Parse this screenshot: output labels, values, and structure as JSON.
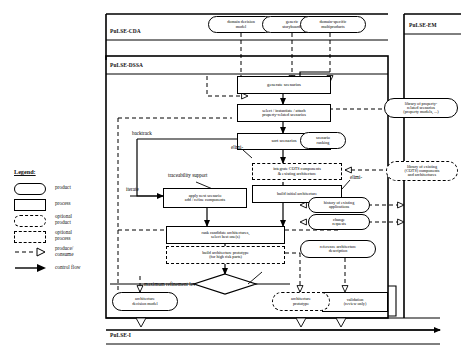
{
  "figure": {
    "caption": ""
  },
  "lanes": [
    {
      "id": "cda",
      "label": "PuLSE-CDA"
    },
    {
      "id": "dssa",
      "label": "PuLSE-DSSA"
    },
    {
      "id": "em",
      "label": "PuLSE-EM"
    },
    {
      "id": "i",
      "label": "PuLSE-I"
    }
  ],
  "products": {
    "domain_decision_model": "domain decision\nmodel",
    "generic_storyboards": "generic\nstoryboards",
    "domain_specific_multiproducts": "domain-specific\nmultiproducts",
    "scenario_ranking": "scenario\nranking",
    "library_property_scenarios": "library of property-\nrelated scenarios\n(property models, ...)",
    "library_cots": "library of existing\n(COTS) components\nand architectures",
    "history_applications": "history of existing\napplications",
    "change_requests": "change\nrequests",
    "reference_architecture_description": "reference architecture\ndescription",
    "architecture_decision_model": "architecture\ndecision model",
    "architecture_prototype": "architecture\nprototype"
  },
  "processes": {
    "generate_scenarios": "generate scenarios",
    "select_instantiate_attach": "select / instantiate / attach\nproperty-related scenarios",
    "sort_scenarios": "sort scenarios",
    "apply_next_scenario": "apply next scenario\nadd / refine components",
    "integrate_cots": "integrate COTS components\n& existing architecture",
    "build_initial_architecture": "build initial architecture",
    "rank_candidate_architectures": "rank candidate architectures,\nselect best one(s)",
    "build_architecture_prototype": "build architecture prototype\n(for high risk parts)",
    "validation": "validation\n(review only)"
  },
  "annotations": {
    "backtrack": "backtrack",
    "traceability_support": "traceability support",
    "iterate": "iterate",
    "elimination_1": "elimi-",
    "elimination_2": "elimi-",
    "max_refinement": "maximum refinement lev-"
  },
  "decision": {
    "label": ""
  },
  "legend": {
    "title": "Legend:",
    "items": [
      {
        "symbol": "product",
        "label": "product"
      },
      {
        "symbol": "process",
        "label": "process"
      },
      {
        "symbol": "optional-product",
        "label": "optional\nproduct"
      },
      {
        "symbol": "optional-process",
        "label": "optional\nprocess"
      },
      {
        "symbol": "produce-consume-arrow",
        "label": "produce/\nconsume"
      },
      {
        "symbol": "control-flow-arrow",
        "label": "control flow"
      }
    ]
  }
}
